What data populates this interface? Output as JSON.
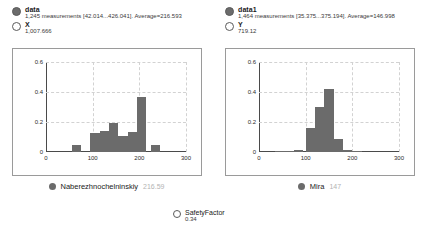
{
  "panels": [
    {
      "id": "left",
      "series_name": "data",
      "summary": "1,245 measurements [42.014...426.041]. Average=216.593",
      "variable_label": "X",
      "variable_value": "1,007.666",
      "footer_name": "Naberezhnochelninskiy",
      "footer_value": "216.59",
      "marker_color": "#6b6b6b",
      "chart_data": {
        "type": "bar",
        "title": "",
        "xlabel": "",
        "ylabel": "",
        "xlim": [
          0,
          300
        ],
        "ylim": [
          0,
          0.6
        ],
        "xticks": [
          "0",
          "100",
          "200",
          "300"
        ],
        "xtick_values": [
          0,
          100,
          200,
          300
        ],
        "yticks": [
          "0",
          "0.2",
          "0.4",
          "0.6"
        ],
        "ytick_values": [
          0,
          0.2,
          0.4,
          0.6
        ],
        "grid": true,
        "bin_width": 20,
        "bin_starts": [
          55,
          95,
          115,
          135,
          155,
          175,
          195,
          225
        ],
        "values": [
          0.05,
          0.13,
          0.14,
          0.195,
          0.105,
          0.135,
          0.365,
          0.05
        ]
      }
    },
    {
      "id": "right",
      "series_name": "data1",
      "summary": "1,464 measurements [35.375...375.194]. Average=146.998",
      "variable_label": "Y",
      "variable_value": "719.12",
      "footer_name": "Mira",
      "footer_value": "147",
      "marker_color": "#6b6b6b",
      "chart_data": {
        "type": "bar",
        "title": "",
        "xlabel": "",
        "ylabel": "",
        "xlim": [
          0,
          300
        ],
        "ylim": [
          0,
          0.6
        ],
        "xticks": [
          "0",
          "100",
          "200",
          "300"
        ],
        "xtick_values": [
          0,
          100,
          200,
          300
        ],
        "yticks": [
          "0",
          "0.2",
          "0.4",
          "0.6"
        ],
        "ytick_values": [
          0,
          0.2,
          0.4,
          0.6
        ],
        "grid": true,
        "bin_width": 20,
        "bin_starts": [
          35,
          55,
          75,
          100,
          120,
          140,
          160,
          180,
          200
        ],
        "values": [
          0.006,
          0.006,
          0.012,
          0.158,
          0.3,
          0.42,
          0.085,
          0.012,
          0.005
        ]
      }
    }
  ],
  "safety": {
    "label": "SafetyFactor",
    "value": "0.34"
  }
}
